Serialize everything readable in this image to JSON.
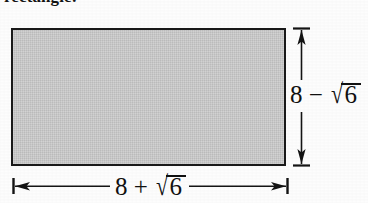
{
  "figure": {
    "name": "shaded-rectangle-with-dimensions",
    "caption_partial": "rectangle:",
    "background_color": "#fdfdfd",
    "ink_color": "#111111"
  },
  "rectangle": {
    "name": "shaded-rectangle",
    "fill_color": "#c9c9c9",
    "stroke_color": "#1a1a1a"
  },
  "dimensions": {
    "height": {
      "label_prefix": "8",
      "operator": "−",
      "radical_sign": "√",
      "radicand": "6",
      "full_text": "8 − √6",
      "orientation": "vertical",
      "arrow_style": "double-headed-with-end-ticks"
    },
    "width": {
      "label_prefix": "8",
      "operator": "+",
      "radical_sign": "√",
      "radicand": "6",
      "full_text": "8 + √6",
      "orientation": "horizontal",
      "arrow_style": "double-headed-with-end-ticks"
    }
  }
}
